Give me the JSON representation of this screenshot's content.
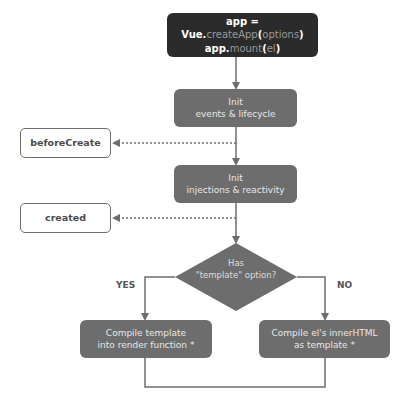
{
  "diagram": {
    "title_node": {
      "line1": {
        "a": "app = Vue.",
        "b": "createApp",
        "c": "(",
        "d": "options",
        "e": ")"
      },
      "line2": {
        "a": "app.",
        "b": "mount",
        "c": "(",
        "d": "el",
        "e": ")"
      }
    },
    "nodes": {
      "init_events": {
        "line1": "Init",
        "line2": "events & lifecycle"
      },
      "init_injections": {
        "line1": "Init",
        "line2": "injections & reactivity"
      },
      "decision": {
        "line1": "Has",
        "line2": "\"template\" option?"
      },
      "compile_template": {
        "line1": "Compile template",
        "line2": "into render function *"
      },
      "compile_el": {
        "line1": "Compile el's innerHTML",
        "line2": "as template *"
      }
    },
    "hooks": {
      "before_create": "beforeCreate",
      "created": "created"
    },
    "branch_labels": {
      "yes": "YES",
      "no": "NO"
    },
    "colors": {
      "dark_box": "#2b2b2b",
      "gray_box": "#6d6d6d",
      "line": "#6d6d6d",
      "hook_border": "#6d6d6d"
    }
  }
}
